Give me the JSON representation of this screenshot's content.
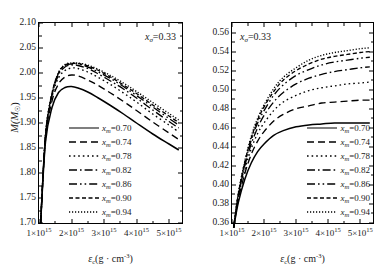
{
  "chart_data": [
    {
      "type": "line",
      "panel": "left",
      "title": "",
      "xlabel": "εc(g·cm⁻³)",
      "ylabel": "M(M☉)",
      "annotation": "xσ=0.33",
      "xlim": [
        1000000000000000.0,
        5400000000000000.0
      ],
      "ylim": [
        1.7,
        2.1
      ],
      "xticks": [
        "1×10^15",
        "2×10^15",
        "3×10^15",
        "4×10^15",
        "5×10^15"
      ],
      "xtick_values": [
        1000000000000000.0,
        2000000000000000.0,
        3000000000000000.0,
        4000000000000000.0,
        5000000000000000.0
      ],
      "yticks": [
        "2.10",
        "2.05",
        "2.00",
        "1.95",
        "1.90",
        "1.85",
        "1.80",
        "1.75",
        "1.70"
      ],
      "ytick_values": [
        2.1,
        2.05,
        2.0,
        1.95,
        1.9,
        1.85,
        1.8,
        1.75,
        1.7
      ],
      "grid": false,
      "legend_position": "lower-center",
      "x": [
        1050000000000000.0,
        1200000000000000.0,
        1400000000000000.0,
        1600000000000000.0,
        1800000000000000.0,
        2000000000000000.0,
        2200000000000000.0,
        2500000000000000.0,
        2800000000000000.0,
        3200000000000000.0,
        3600000000000000.0,
        4000000000000000.0,
        4500000000000000.0,
        5000000000000000.0,
        5300000000000000.0
      ],
      "series": [
        {
          "name": "xm=0.70",
          "dash": "solid",
          "values": [
            1.7,
            1.862,
            1.931,
            1.961,
            1.971,
            1.973,
            1.97,
            1.962,
            1.951,
            1.935,
            1.918,
            1.9,
            1.878,
            1.858,
            1.846
          ]
        },
        {
          "name": "xm=0.74",
          "dash": "dashed",
          "values": [
            1.7,
            1.868,
            1.944,
            1.978,
            1.992,
            1.996,
            1.994,
            1.986,
            1.976,
            1.96,
            1.943,
            1.925,
            1.902,
            1.88,
            1.867
          ]
        },
        {
          "name": "xm=0.78",
          "dash": "dotted",
          "values": [
            1.7,
            1.872,
            1.952,
            1.99,
            2.005,
            2.01,
            2.009,
            2.002,
            1.992,
            1.977,
            1.96,
            1.942,
            1.918,
            1.896,
            1.882
          ]
        },
        {
          "name": "xm=0.82",
          "dash": "dashdot",
          "values": [
            1.7,
            1.874,
            1.956,
            1.996,
            2.012,
            2.016,
            2.015,
            2.009,
            1.999,
            1.984,
            1.968,
            1.95,
            1.926,
            1.903,
            1.89
          ]
        },
        {
          "name": "xm=0.86",
          "dash": "dashdotdot",
          "values": [
            1.7,
            1.875,
            1.958,
            1.999,
            2.015,
            2.018,
            2.018,
            2.012,
            2.003,
            1.989,
            1.973,
            1.955,
            1.932,
            1.909,
            1.896
          ]
        },
        {
          "name": "xm=0.90",
          "dash": "shortdash",
          "values": [
            1.7,
            1.876,
            1.959,
            2.0,
            2.016,
            2.019,
            2.019,
            2.014,
            2.006,
            1.992,
            1.976,
            1.959,
            1.936,
            1.914,
            1.901
          ]
        },
        {
          "name": "xm=0.94",
          "dash": "densedot",
          "values": [
            1.7,
            1.876,
            1.96,
            2.001,
            2.017,
            2.02,
            2.02,
            2.016,
            2.008,
            1.995,
            1.98,
            1.963,
            1.941,
            1.919,
            1.906
          ]
        }
      ]
    },
    {
      "type": "line",
      "panel": "right",
      "title": "",
      "xlabel": "εc(g·cm⁻³)",
      "ylabel": "x",
      "annotation": "xσ=0.33",
      "xlim": [
        1000000000000000.0,
        5400000000000000.0
      ],
      "ylim": [
        0.36,
        0.57
      ],
      "xticks": [
        "1×10^15",
        "2×10^15",
        "3×10^15",
        "4×10^15",
        "5×10^15"
      ],
      "xtick_values": [
        1000000000000000.0,
        2000000000000000.0,
        3000000000000000.0,
        4000000000000000.0,
        5000000000000000.0
      ],
      "yticks": [
        "0.56",
        "0.54",
        "0.52",
        "0.50",
        "0.48",
        "0.46",
        "0.44",
        "0.42",
        "0.40",
        "0.38",
        "0.36"
      ],
      "ytick_values": [
        0.56,
        0.54,
        0.52,
        0.5,
        0.48,
        0.46,
        0.44,
        0.42,
        0.4,
        0.38,
        0.36
      ],
      "grid": false,
      "legend_position": "lower-right",
      "x": [
        1050000000000000.0,
        1200000000000000.0,
        1400000000000000.0,
        1600000000000000.0,
        1800000000000000.0,
        2000000000000000.0,
        2300000000000000.0,
        2600000000000000.0,
        3000000000000000.0,
        3400000000000000.0,
        3800000000000000.0,
        4200000000000000.0,
        4600000000000000.0,
        5000000000000000.0,
        5300000000000000.0
      ],
      "series": [
        {
          "name": "xm=0.70",
          "dash": "solid",
          "values": [
            0.355,
            0.382,
            0.406,
            0.423,
            0.435,
            0.443,
            0.452,
            0.457,
            0.461,
            0.463,
            0.464,
            0.465,
            0.465,
            0.465,
            0.465
          ]
        },
        {
          "name": "xm=0.74",
          "dash": "dashed",
          "values": [
            0.355,
            0.385,
            0.412,
            0.432,
            0.446,
            0.456,
            0.467,
            0.474,
            0.48,
            0.483,
            0.486,
            0.487,
            0.488,
            0.489,
            0.489
          ]
        },
        {
          "name": "xm=0.78",
          "dash": "dotted",
          "values": [
            0.355,
            0.387,
            0.416,
            0.438,
            0.454,
            0.465,
            0.478,
            0.487,
            0.494,
            0.499,
            0.502,
            0.504,
            0.506,
            0.507,
            0.508
          ]
        },
        {
          "name": "xm=0.82",
          "dash": "dashdot",
          "values": [
            0.355,
            0.389,
            0.42,
            0.443,
            0.46,
            0.473,
            0.487,
            0.497,
            0.506,
            0.512,
            0.516,
            0.519,
            0.521,
            0.523,
            0.524
          ]
        },
        {
          "name": "xm=0.86",
          "dash": "dashdotdot",
          "values": [
            0.355,
            0.39,
            0.422,
            0.447,
            0.465,
            0.478,
            0.494,
            0.505,
            0.515,
            0.521,
            0.526,
            0.529,
            0.531,
            0.533,
            0.534
          ]
        },
        {
          "name": "xm=0.90",
          "dash": "shortdash",
          "values": [
            0.355,
            0.391,
            0.424,
            0.449,
            0.468,
            0.482,
            0.498,
            0.51,
            0.52,
            0.527,
            0.532,
            0.535,
            0.537,
            0.539,
            0.54
          ]
        },
        {
          "name": "xm=0.94",
          "dash": "densedot",
          "values": [
            0.355,
            0.392,
            0.425,
            0.451,
            0.47,
            0.484,
            0.501,
            0.513,
            0.523,
            0.531,
            0.536,
            0.539,
            0.541,
            0.543,
            0.544
          ]
        }
      ]
    }
  ],
  "left_panel": {
    "annotation_base": "x",
    "annotation_sub": "σ",
    "annotation_value": "=0.33",
    "ylabel_main": "M(M",
    "ylabel_sub": "☉",
    "ylabel_tail": ")",
    "xlabel_sym": "ε",
    "xlabel_sub": "c",
    "xlabel_rest": "(g · cm",
    "xlabel_sup": "-3",
    "xlabel_end": ")",
    "yticks": [
      "2.10",
      "2.05",
      "2.00",
      "1.95",
      "1.90",
      "1.85",
      "1.80",
      "1.75",
      "1.70"
    ],
    "xticks": [
      "1×10",
      "2×10",
      "3×10",
      "4×10",
      "5×10"
    ],
    "xtick_exp": "15",
    "legend": [
      {
        "label_base": "x",
        "label_sub": "m",
        "label_value": "=0.70"
      },
      {
        "label_base": "x",
        "label_sub": "m",
        "label_value": "=0.74"
      },
      {
        "label_base": "x",
        "label_sub": "m",
        "label_value": "=0.78"
      },
      {
        "label_base": "x",
        "label_sub": "m",
        "label_value": "=0.82"
      },
      {
        "label_base": "x",
        "label_sub": "m",
        "label_value": "=0.86"
      },
      {
        "label_base": "x",
        "label_sub": "m",
        "label_value": "=0.90"
      },
      {
        "label_base": "x",
        "label_sub": "m",
        "label_value": "=0.94"
      }
    ]
  },
  "right_panel": {
    "annotation_base": "x",
    "annotation_sub": "σ",
    "annotation_value": "=0.33",
    "ylabel_main": "x",
    "xlabel_sym": "ε",
    "xlabel_sub": "c",
    "xlabel_rest": "(g · cm",
    "xlabel_sup": "-3",
    "xlabel_end": ")",
    "yticks": [
      "0.56",
      "0.54",
      "0.52",
      "0.50",
      "0.48",
      "0.46",
      "0.44",
      "0.42",
      "0.40",
      "0.38",
      "0.36"
    ],
    "xticks": [
      "1×10",
      "2×10",
      "3×10",
      "4×10",
      "5×10"
    ],
    "xtick_exp": "15",
    "legend": [
      {
        "label_base": "x",
        "label_sub": "m",
        "label_value": "=0.70"
      },
      {
        "label_base": "x",
        "label_sub": "m",
        "label_value": "=0.74"
      },
      {
        "label_base": "x",
        "label_sub": "m",
        "label_value": "=0.78"
      },
      {
        "label_base": "x",
        "label_sub": "m",
        "label_value": "=0.82"
      },
      {
        "label_base": "x",
        "label_sub": "m",
        "label_value": "=0.86"
      },
      {
        "label_base": "x",
        "label_sub": "m",
        "label_value": "=0.90"
      },
      {
        "label_base": "x",
        "label_sub": "m",
        "label_value": "=0.94"
      }
    ]
  }
}
